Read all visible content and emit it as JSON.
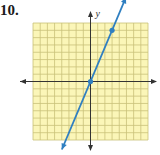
{
  "problem_number": "10.",
  "chart_data": {
    "type": "line",
    "title": "",
    "xlabel": "x",
    "ylabel": "y",
    "xlim": [
      -8,
      8
    ],
    "ylim": [
      -8,
      8
    ],
    "grid": true,
    "series": [
      {
        "name": "line",
        "points": [
          [
            0,
            0
          ],
          [
            3,
            7
          ]
        ],
        "slope": 2.333,
        "intercept": 0,
        "color": "#2f7fc1"
      }
    ]
  },
  "colors": {
    "grid_fill": "#fbf6b8",
    "grid_line": "#c9c27a",
    "axis": "#333333",
    "line": "#2f7fc1"
  }
}
